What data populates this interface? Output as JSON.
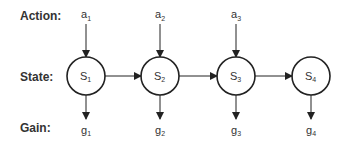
{
  "rows": {
    "action": "Action:",
    "state": "State:",
    "gain": "Gain:"
  },
  "actions": [
    {
      "base": "a",
      "sub": "1"
    },
    {
      "base": "a",
      "sub": "2"
    },
    {
      "base": "a",
      "sub": "3"
    }
  ],
  "states": [
    {
      "base": "S",
      "sub": "1"
    },
    {
      "base": "S",
      "sub": "2"
    },
    {
      "base": "S",
      "sub": "3"
    },
    {
      "base": "S",
      "sub": "4"
    }
  ],
  "gains": [
    {
      "base": "g",
      "sub": "1"
    },
    {
      "base": "g",
      "sub": "2"
    },
    {
      "base": "g",
      "sub": "3"
    },
    {
      "base": "g",
      "sub": "4"
    }
  ],
  "colors": {
    "stroke": "#222222",
    "text": "#333333"
  }
}
